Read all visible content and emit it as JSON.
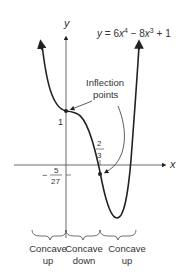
{
  "equation": {
    "lhs": "y",
    "eq": " = 6",
    "x1": "x",
    "p1": "4",
    "mid": " − 8",
    "x2": "x",
    "p2": "3",
    "rhs": " + 1"
  },
  "axes": {
    "x_label": "x",
    "y_label": "y"
  },
  "annotation": {
    "line1": "Inflection",
    "line2": "points"
  },
  "ticks": {
    "y_one": "1",
    "x_num": "2",
    "x_den": "3",
    "neg_sign": "−",
    "y_num": "5",
    "y_den": "27"
  },
  "regions": [
    {
      "line1": "Concave",
      "line2": "up"
    },
    {
      "line1": "Concave",
      "line2": "down"
    },
    {
      "line1": "Concave",
      "line2": "up"
    }
  ],
  "colors": {
    "ink": "#222222",
    "text": "#333333"
  }
}
